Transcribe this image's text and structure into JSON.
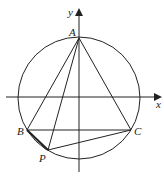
{
  "diagram": {
    "type": "geometry",
    "axes": {
      "x_label": "x",
      "y_label": "y"
    },
    "circle": {
      "cx": 79,
      "cy": 98,
      "r": 61
    },
    "points": {
      "A": {
        "label": "A",
        "x": 79,
        "y": 38
      },
      "B": {
        "label": "B",
        "x": 27,
        "y": 130
      },
      "C": {
        "label": "C",
        "x": 131,
        "y": 130
      },
      "P": {
        "label": "P",
        "x": 48,
        "y": 150
      }
    },
    "segments": [
      "AB",
      "AC",
      "AP",
      "BC",
      "PC",
      "BP"
    ],
    "colors": {
      "stroke": "#222222",
      "background": "#ffffff"
    }
  }
}
